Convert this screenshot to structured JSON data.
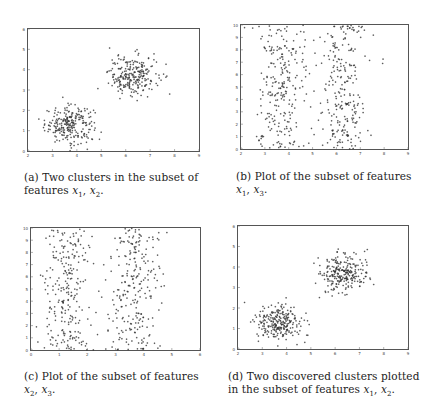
{
  "figure": {
    "panels": [
      {
        "id": "a",
        "caption_line1": "(a) Two clusters in the subset of",
        "caption_line2": "features x1, x2."
      },
      {
        "id": "b",
        "caption_line1": "(b) Plot of the subset of features",
        "caption_line2": "x1, x3."
      },
      {
        "id": "c",
        "caption_line1": "(c) Plot of the subset of features",
        "caption_line2": "x2, x3."
      },
      {
        "id": "d",
        "caption_line1": "(d) Two discovered clusters plotted",
        "caption_line2": "in the subset of features x1, x2."
      }
    ]
  },
  "chart_data": [
    {
      "type": "scatter",
      "panel": "a",
      "title": "Two clusters in the subset of features x1, x2",
      "xlabel": "x1",
      "ylabel": "x2",
      "xlim": [
        2,
        9
      ],
      "ylim": [
        0,
        6
      ],
      "xticks": [
        2,
        3,
        4,
        5,
        6,
        7,
        8,
        9
      ],
      "yticks": [
        0,
        1,
        2,
        3,
        4,
        5,
        6
      ],
      "series": [
        {
          "name": "cluster 1",
          "center": [
            3.7,
            1.3
          ],
          "spread": [
            0.5,
            0.45
          ],
          "n": 250
        },
        {
          "name": "cluster 2",
          "center": [
            6.3,
            3.7
          ],
          "spread": [
            0.5,
            0.5
          ],
          "n": 250
        }
      ]
    },
    {
      "type": "scatter",
      "panel": "b",
      "title": "Plot of the subset of features x1, x3",
      "xlabel": "x1",
      "ylabel": "x3",
      "xlim": [
        2,
        9
      ],
      "ylim": [
        0,
        10
      ],
      "xticks": [
        2,
        3,
        4,
        5,
        6,
        7,
        8,
        9
      ],
      "yticks": [
        0,
        1,
        2,
        3,
        4,
        5,
        6,
        7,
        8,
        9,
        10
      ],
      "series": [
        {
          "name": "group 1",
          "x_center": 3.7,
          "x_spread": 0.5,
          "y_range": [
            0,
            10
          ],
          "n": 250
        },
        {
          "name": "group 2",
          "x_center": 6.3,
          "x_spread": 0.5,
          "y_range": [
            0,
            10
          ],
          "n": 250
        }
      ]
    },
    {
      "type": "scatter",
      "panel": "c",
      "title": "Plot of the subset of features x2, x3",
      "xlabel": "x2",
      "ylabel": "x3",
      "xlim": [
        0,
        6
      ],
      "ylim": [
        0,
        10
      ],
      "xticks": [
        0,
        1,
        2,
        3,
        4,
        5,
        6
      ],
      "yticks": [
        0,
        1,
        2,
        3,
        4,
        5,
        6,
        7,
        8,
        9,
        10
      ],
      "series": [
        {
          "name": "group 1",
          "x_center": 1.3,
          "x_spread": 0.45,
          "y_range": [
            0,
            10
          ],
          "n": 250
        },
        {
          "name": "group 2",
          "x_center": 3.7,
          "x_spread": 0.5,
          "y_range": [
            0,
            10
          ],
          "n": 250
        }
      ]
    },
    {
      "type": "scatter",
      "panel": "d",
      "title": "Two discovered clusters plotted in the subset of features x1, x2",
      "xlabel": "x1",
      "ylabel": "x2",
      "xlim": [
        2,
        9
      ],
      "ylim": [
        0,
        6
      ],
      "xticks": [
        2,
        3,
        4,
        5,
        6,
        7,
        8,
        9
      ],
      "yticks": [
        0,
        1,
        2,
        3,
        4,
        5,
        6
      ],
      "series": [
        {
          "name": "discovered cluster 1",
          "center": [
            3.7,
            1.3
          ],
          "spread": [
            0.5,
            0.45
          ],
          "n": 250
        },
        {
          "name": "discovered cluster 2",
          "center": [
            6.3,
            3.7
          ],
          "spread": [
            0.5,
            0.5
          ],
          "n": 250
        }
      ]
    }
  ]
}
